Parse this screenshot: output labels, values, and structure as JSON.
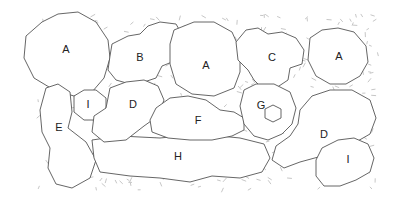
{
  "diagram": {
    "type": "planting-plan",
    "colors": {
      "background": "#ffffff",
      "outline": "#555555",
      "mulch_texture": "#b8b8b8",
      "label": "#222222"
    },
    "bed": {
      "x": 38,
      "y": 14,
      "width": 340,
      "height": 176
    },
    "plants": [
      {
        "id": "A1",
        "label": "A",
        "lx": 66,
        "ly": 49,
        "cx": 66,
        "cy": 52,
        "rx": 43,
        "ry": 43
      },
      {
        "id": "B",
        "label": "B",
        "lx": 140,
        "ly": 57,
        "cx": 148,
        "cy": 62,
        "rx": 40,
        "ry": 30
      },
      {
        "id": "A2",
        "label": "A",
        "lx": 206,
        "ly": 65,
        "cx": 205,
        "cy": 62,
        "rx": 38,
        "ry": 40
      },
      {
        "id": "C",
        "label": "C",
        "lx": 272,
        "ly": 57,
        "cx": 270,
        "cy": 56,
        "rx": 35,
        "ry": 30
      },
      {
        "id": "A3",
        "label": "A",
        "lx": 339,
        "ly": 56,
        "cx": 338,
        "cy": 56,
        "rx": 30,
        "ry": 30
      },
      {
        "id": "I1",
        "label": "I",
        "lx": 88,
        "ly": 104,
        "cx": 88,
        "cy": 104,
        "rx": 18,
        "ry": 18
      },
      {
        "id": "D1",
        "label": "D",
        "lx": 133,
        "ly": 104,
        "cx": 127,
        "cy": 110,
        "rx": 33,
        "ry": 28
      },
      {
        "id": "E",
        "label": "E",
        "lx": 59,
        "ly": 127,
        "cx": 62,
        "cy": 135,
        "rx": 22,
        "ry": 42
      },
      {
        "id": "F",
        "label": "F",
        "lx": 198,
        "ly": 120,
        "cx": 196,
        "cy": 120,
        "rx": 44,
        "ry": 20
      },
      {
        "id": "G",
        "label": "G",
        "lx": 261,
        "ly": 105,
        "cx": 268,
        "cy": 110,
        "rx": 30,
        "ry": 30
      },
      {
        "id": "H",
        "label": "H",
        "lx": 178,
        "ly": 156,
        "cx": 178,
        "cy": 155,
        "rx": 90,
        "ry": 20
      },
      {
        "id": "D2",
        "label": "D",
        "lx": 324,
        "ly": 134,
        "cx": 322,
        "cy": 130,
        "rx": 50,
        "ry": 38
      },
      {
        "id": "I2",
        "label": "I",
        "lx": 348,
        "ly": 159,
        "cx": 345,
        "cy": 162,
        "rx": 30,
        "ry": 24
      }
    ],
    "feature": {
      "name": "hexagon-stone",
      "cx": 273,
      "cy": 114,
      "r": 9
    }
  }
}
